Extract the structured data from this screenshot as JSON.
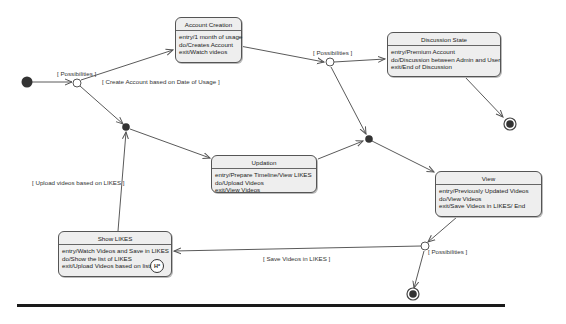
{
  "diagram": {
    "type": "UML state machine diagram",
    "colors": {
      "state_fill": "#eeeeee",
      "state_border": "#555555",
      "edge": "#555555",
      "node_fill": "#333333",
      "rule": "#1a1a1a"
    },
    "states": [
      {
        "id": "account-creation",
        "title": "Account Creation",
        "lines": [
          "entry/1 month of usage",
          "do/Creates Account",
          "exit/Watch videos"
        ]
      },
      {
        "id": "discussion-state",
        "title": "Discussion State",
        "lines": [
          "entry/Premium Account",
          "do/Discussion between Admin and User",
          "exit/End of Discussion"
        ]
      },
      {
        "id": "updation",
        "title": "Updation",
        "lines": [
          "entry/Prepare Timeline/View LIKES",
          "do/Upload Videos",
          "exit/View Videos"
        ]
      },
      {
        "id": "view",
        "title": "View",
        "lines": [
          "entry/Previously Updated Videos",
          "do/View Videos",
          "exit/Save Videos in LIKES/ End"
        ]
      },
      {
        "id": "show-likes",
        "title": "Show LIKES",
        "lines": [
          "entry/Watch Videos and Save in LIKES",
          "do/Show the list of LIKES",
          "exit/Upload Videos based on list"
        ],
        "history_marker": "H*"
      }
    ],
    "guards": {
      "possibilities_1": "[ Possibilities ]",
      "create_account": "[ Create Account based on Date of Usage ]",
      "possibilities_2": "[ Possibilities ]",
      "upload_videos": "[ Upload videos based on LIKES ]",
      "save_videos": "[ Save Videos in LIKES ]",
      "possibilities_3": "[ Possibilities ]"
    },
    "pseudostates": {
      "initial": "initial-node",
      "choices": 3,
      "junctions": 2,
      "finals": 2
    }
  }
}
